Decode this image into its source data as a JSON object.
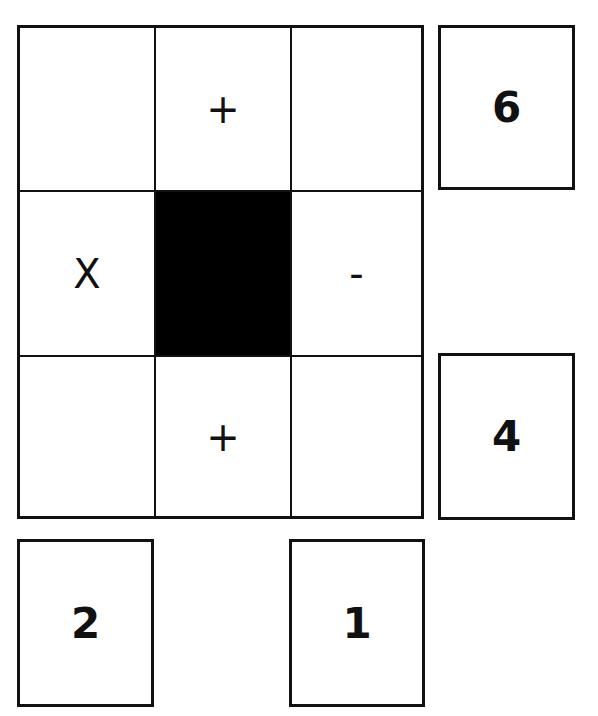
{
  "puzzle": {
    "grid": [
      [
        {
          "symbol": "",
          "filled": false
        },
        {
          "symbol": "+",
          "filled": false
        },
        {
          "symbol": "",
          "filled": false
        }
      ],
      [
        {
          "symbol": "X",
          "filled": false
        },
        {
          "symbol": "",
          "filled": true
        },
        {
          "symbol": "-",
          "filled": false
        }
      ],
      [
        {
          "symbol": "",
          "filled": false
        },
        {
          "symbol": "+",
          "filled": false
        },
        {
          "symbol": "",
          "filled": false
        }
      ]
    ],
    "right_clues": {
      "row1": "6",
      "row3": "4"
    },
    "bottom_clues": {
      "col1": "2",
      "col3": "1"
    },
    "colors": {
      "line": "#111111",
      "filled_cell": "#000000",
      "background": "#ffffff"
    }
  }
}
